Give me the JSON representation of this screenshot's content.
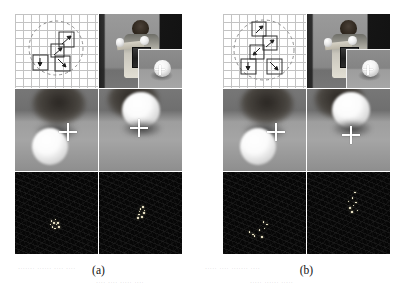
{
  "figure": {
    "width": 401,
    "height": 293,
    "background": "#ffffff",
    "caption_a": "(a)",
    "caption_b": "(b)"
  },
  "groups": [
    {
      "id": "a",
      "label": "(a)",
      "panels": {
        "roi_diagram": {
          "name": "grid-roi-diagram",
          "grid_cell_px": 8,
          "grid_color": "#b9b9b9",
          "circle": {
            "cx": 41,
            "cy": 34,
            "r": 27,
            "style": "dashed",
            "color": "#8d8d8d"
          },
          "boxes": [
            {
              "x": 44,
              "y": 18,
              "w": 15,
              "h": 15,
              "arrow_from": [
                47,
                30
              ],
              "arrow_to": [
                57,
                21
              ]
            },
            {
              "x": 36,
              "y": 30,
              "w": 13,
              "h": 13,
              "arrow_from": [
                39,
                41
              ],
              "arrow_to": [
                47,
                33
              ]
            },
            {
              "x": 18,
              "y": 41,
              "w": 15,
              "h": 15,
              "arrow_from": [
                25,
                44
              ],
              "arrow_to": [
                25,
                53
              ]
            },
            {
              "x": 40,
              "y": 42,
              "w": 15,
              "h": 15,
              "arrow_from": [
                43,
                45
              ],
              "arrow_to": [
                52,
                54
              ]
            }
          ]
        },
        "photo": {
          "name": "camera-photo-person",
          "inset_label": "zoomed-inset"
        },
        "closeup_left": {
          "name": "blurred-closeup-left",
          "crosshair": {
            "x": 53,
            "y": 43
          }
        },
        "closeup_right": {
          "name": "blurred-closeup-right",
          "crosshair": {
            "x": 40,
            "y": 40
          }
        },
        "features_left": {
          "name": "feature-response-left",
          "dots": [
            [
              36,
              49
            ],
            [
              38,
              50
            ],
            [
              40,
              47
            ],
            [
              41,
              52
            ],
            [
              37,
              54
            ],
            [
              39,
              56
            ],
            [
              42,
              50
            ],
            [
              35,
              52
            ],
            [
              43,
              54
            ]
          ]
        },
        "features_right": {
          "name": "feature-response-right",
          "dots": [
            [
              41,
              36
            ],
            [
              44,
              40
            ],
            [
              39,
              42
            ],
            [
              42,
              44
            ],
            [
              45,
              38
            ],
            [
              38,
              45
            ],
            [
              43,
              35
            ],
            [
              40,
              39
            ]
          ]
        }
      }
    },
    {
      "id": "b",
      "label": "(b)",
      "panels": {
        "roi_diagram": {
          "name": "grid-roi-diagram",
          "grid_cell_px": 8,
          "grid_color": "#b9b9b9",
          "circle": {
            "cx": 41,
            "cy": 36,
            "r": 30,
            "style": "dashed",
            "color": "#8d8d8d"
          },
          "boxes": [
            {
              "x": 29,
              "y": 8,
              "w": 14,
              "h": 14,
              "arrow_from": [
                33,
                19
              ],
              "arrow_to": [
                40,
                11
              ]
            },
            {
              "x": 40,
              "y": 22,
              "w": 14,
              "h": 14,
              "arrow_from": [
                43,
                33
              ],
              "arrow_to": [
                51,
                25
              ]
            },
            {
              "x": 27,
              "y": 31,
              "w": 14,
              "h": 14,
              "arrow_from": [
                37,
                34
              ],
              "arrow_to": [
                29,
                42
              ]
            },
            {
              "x": 18,
              "y": 45,
              "w": 15,
              "h": 15,
              "arrow_from": [
                25,
                48
              ],
              "arrow_to": [
                25,
                57
              ]
            },
            {
              "x": 44,
              "y": 45,
              "w": 15,
              "h": 15,
              "arrow_from": [
                47,
                48
              ],
              "arrow_to": [
                56,
                57
              ]
            }
          ]
        },
        "photo": {
          "name": "camera-photo-person",
          "inset_label": "zoomed-inset"
        },
        "closeup_left": {
          "name": "blurred-closeup-left",
          "crosshair": {
            "x": 53,
            "y": 43
          }
        },
        "closeup_right": {
          "name": "blurred-closeup-right",
          "crosshair": {
            "x": 44,
            "y": 46
          }
        },
        "features_left": {
          "name": "feature-response-left",
          "dots": [
            [
              26,
              60
            ],
            [
              29,
              62
            ],
            [
              40,
              50
            ],
            [
              41,
              56
            ],
            [
              38,
              65
            ],
            [
              43,
              52
            ],
            [
              36,
              58
            ],
            [
              31,
              64
            ]
          ]
        },
        "features_right": {
          "name": "feature-response-right",
          "dots": [
            [
              47,
              20
            ],
            [
              45,
              26
            ],
            [
              48,
              30
            ],
            [
              42,
              36
            ],
            [
              50,
              38
            ],
            [
              44,
              40
            ],
            [
              46,
              33
            ],
            [
              41,
              29
            ]
          ]
        }
      }
    }
  ]
}
